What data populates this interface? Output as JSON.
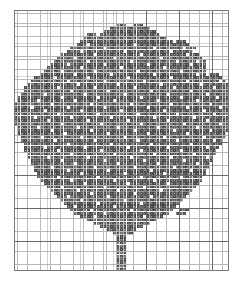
{
  "document": {
    "title": "Tree Cross-Stitch Pattern Chart",
    "kind": "counted cross-stitch / needlepoint chart",
    "subject": "deciduous tree with full leafy crown and straight trunk",
    "background_color": "#ffffff"
  },
  "grid": {
    "origin_x": 14,
    "origin_y": 10,
    "columns": 65,
    "rows": 79,
    "cell_size": 3.3,
    "minor_line_color": "#b8b8b8",
    "major_line_color": "#6b6b6b",
    "major_every": 10,
    "border_color": "#7a7a7a",
    "grid_on": true
  },
  "symbol": {
    "name": "filled-stitch",
    "fill_color": "#4a4a4a",
    "texture": "checker-dot",
    "empty_color": "#ffffff"
  },
  "chart_data": {
    "type": "heatmap",
    "title": "Tree Cross-Stitch Pattern Chart",
    "subtitle": "",
    "xlabel": "",
    "ylabel": "",
    "legend": [
      {
        "symbol": "filled-stitch",
        "label": "stitched cell",
        "color": "#4a4a4a"
      },
      {
        "symbol": "blank",
        "label": "unstitched cell",
        "color": "#ffffff"
      }
    ],
    "legend_position": "none",
    "grid": true,
    "xlim": [
      0,
      65
    ],
    "ylim": [
      0,
      79
    ],
    "categories": [],
    "values": [],
    "note": "Each row is encoded as run-length pairs of [start_column, length] of stitched (filled) cells. Columns are 0-indexed from the left edge of the grid; rows 0-indexed from the top.",
    "rows_rle": [
      [],
      [],
      [],
      [],
      [
        [
          31,
          3
        ],
        [
          36,
          3
        ]
      ],
      [
        [
          29,
          12
        ]
      ],
      [
        [
          27,
          16
        ]
      ],
      [
        [
          22,
          3
        ],
        [
          26,
          18
        ]
      ],
      [
        [
          21,
          5
        ],
        [
          25,
          21
        ]
      ],
      [
        [
          20,
          28
        ],
        [
          49,
          3
        ]
      ],
      [
        [
          19,
          30
        ],
        [
          48,
          5
        ]
      ],
      [
        [
          17,
          34
        ],
        [
          52,
          3
        ]
      ],
      [
        [
          16,
          38
        ]
      ],
      [
        [
          14,
          42
        ]
      ],
      [
        [
          13,
          44
        ]
      ],
      [
        [
          12,
          46
        ]
      ],
      [
        [
          11,
          47
        ]
      ],
      [
        [
          10,
          48
        ]
      ],
      [
        [
          9,
          49
        ]
      ],
      [
        [
          8,
          50
        ],
        [
          59,
          3
        ]
      ],
      [
        [
          6,
          3
        ],
        [
          9,
          49
        ],
        [
          58,
          5
        ]
      ],
      [
        [
          5,
          5
        ],
        [
          9,
          50
        ],
        [
          57,
          7
        ]
      ],
      [
        [
          4,
          7
        ],
        [
          10,
          50
        ],
        [
          57,
          8
        ]
      ],
      [
        [
          3,
          9
        ],
        [
          10,
          52
        ],
        [
          56,
          9
        ]
      ],
      [
        [
          3,
          62
        ]
      ],
      [
        [
          2,
          63
        ]
      ],
      [
        [
          1,
          64
        ]
      ],
      [
        [
          1,
          64
        ]
      ],
      [
        [
          0,
          65
        ]
      ],
      [
        [
          0,
          65
        ]
      ],
      [
        [
          0,
          65
        ]
      ],
      [
        [
          0,
          65
        ]
      ],
      [
        [
          0,
          65
        ]
      ],
      [
        [
          0,
          65
        ]
      ],
      [
        [
          0,
          65
        ]
      ],
      [
        [
          1,
          64
        ]
      ],
      [
        [
          1,
          64
        ]
      ],
      [
        [
          1,
          63
        ]
      ],
      [
        [
          2,
          62
        ]
      ],
      [
        [
          2,
          61
        ]
      ],
      [
        [
          3,
          60
        ]
      ],
      [
        [
          3,
          59
        ]
      ],
      [
        [
          3,
          58
        ]
      ],
      [
        [
          4,
          57
        ]
      ],
      [
        [
          4,
          56
        ]
      ],
      [
        [
          5,
          55
        ]
      ],
      [
        [
          5,
          54
        ]
      ],
      [
        [
          6,
          53
        ]
      ],
      [
        [
          6,
          52
        ]
      ],
      [
        [
          7,
          51
        ]
      ],
      [
        [
          7,
          50
        ]
      ],
      [
        [
          8,
          49
        ]
      ],
      [
        [
          9,
          47
        ]
      ],
      [
        [
          10,
          45
        ]
      ],
      [
        [
          11,
          43
        ]
      ],
      [
        [
          12,
          41
        ]
      ],
      [
        [
          13,
          39
        ]
      ],
      [
        [
          14,
          37
        ]
      ],
      [
        [
          15,
          35
        ]
      ],
      [
        [
          16,
          33
        ]
      ],
      [
        [
          17,
          31
        ],
        [
          50,
          3
        ]
      ],
      [
        [
          18,
          29
        ],
        [
          49,
          3
        ]
      ],
      [
        [
          20,
          25
        ]
      ],
      [
        [
          22,
          21
        ]
      ],
      [
        [
          24,
          17
        ]
      ],
      [
        [
          26,
          13
        ]
      ],
      [
        [
          28,
          9
        ]
      ],
      [
        [
          30,
          6
        ]
      ],
      [
        [
          31,
          3
        ]
      ],
      [
        [
          31,
          3
        ]
      ],
      [
        [
          31,
          3
        ]
      ],
      [
        [
          31,
          3
        ]
      ],
      [
        [
          31,
          3
        ]
      ],
      [
        [
          31,
          3
        ]
      ],
      [
        [
          31,
          3
        ]
      ],
      [
        [
          31,
          3
        ]
      ],
      [
        [
          31,
          3
        ]
      ],
      [
        [
          31,
          3
        ]
      ],
      [
        [
          31,
          3
        ]
      ],
      []
    ],
    "holes_rle": [
      [],
      [],
      [],
      [],
      [],
      [],
      [],
      [],
      [],
      [],
      [
        [
          22,
          1
        ],
        [
          36,
          1
        ]
      ],
      [
        [
          27,
          1
        ],
        [
          42,
          1
        ]
      ],
      [
        [
          20,
          1
        ],
        [
          33,
          1
        ],
        [
          47,
          1
        ]
      ],
      [
        [
          24,
          1
        ],
        [
          38,
          1
        ],
        [
          52,
          1
        ]
      ],
      [
        [
          18,
          1
        ],
        [
          30,
          1
        ],
        [
          44,
          1
        ]
      ],
      [
        [
          22,
          1
        ],
        [
          35,
          1
        ],
        [
          49,
          1
        ],
        [
          55,
          1
        ]
      ],
      [
        [
          16,
          1
        ],
        [
          27,
          1
        ],
        [
          40,
          1
        ],
        [
          53,
          1
        ]
      ],
      [
        [
          20,
          1
        ],
        [
          32,
          1
        ],
        [
          45,
          1
        ],
        [
          58,
          1
        ]
      ],
      [
        [
          14,
          1
        ],
        [
          24,
          1
        ],
        [
          37,
          1
        ],
        [
          50,
          1
        ]
      ],
      [
        [
          18,
          1
        ],
        [
          29,
          1
        ],
        [
          42,
          1
        ],
        [
          55,
          1
        ]
      ],
      [
        [
          12,
          1
        ],
        [
          22,
          1
        ],
        [
          34,
          1
        ],
        [
          47,
          1
        ]
      ],
      [
        [
          16,
          1
        ],
        [
          27,
          1
        ],
        [
          39,
          1
        ],
        [
          52,
          1
        ],
        [
          62,
          1
        ]
      ],
      [
        [
          19,
          1
        ],
        [
          31,
          1
        ],
        [
          44,
          1
        ],
        [
          56,
          1
        ]
      ],
      [
        [
          13,
          1
        ],
        [
          24,
          1
        ],
        [
          36,
          1
        ],
        [
          48,
          1
        ],
        [
          60,
          1
        ]
      ],
      [
        [
          17,
          1
        ],
        [
          28,
          1
        ],
        [
          41,
          1
        ],
        [
          53,
          1
        ]
      ],
      [
        [
          9,
          1
        ],
        [
          21,
          1
        ],
        [
          33,
          1
        ],
        [
          46,
          1
        ],
        [
          58,
          1
        ]
      ],
      [
        [
          14,
          1
        ],
        [
          25,
          1
        ],
        [
          38,
          1
        ],
        [
          50,
          1
        ],
        [
          61,
          1
        ]
      ],
      [
        [
          7,
          1
        ],
        [
          18,
          1
        ],
        [
          30,
          1
        ],
        [
          43,
          1
        ],
        [
          55,
          1
        ]
      ],
      [
        [
          11,
          1
        ],
        [
          23,
          1
        ],
        [
          35,
          1
        ],
        [
          47,
          1
        ],
        [
          59,
          1
        ]
      ],
      [
        [
          5,
          1
        ],
        [
          16,
          1
        ],
        [
          27,
          1
        ],
        [
          40,
          1
        ],
        [
          52,
          1
        ],
        [
          62,
          1
        ]
      ],
      [
        [
          9,
          1
        ],
        [
          20,
          1
        ],
        [
          32,
          1
        ],
        [
          45,
          1
        ],
        [
          57,
          1
        ]
      ],
      [
        [
          13,
          1
        ],
        [
          25,
          1
        ],
        [
          37,
          1
        ],
        [
          49,
          1
        ],
        [
          60,
          1
        ]
      ],
      [
        [
          6,
          1
        ],
        [
          17,
          1
        ],
        [
          29,
          1
        ],
        [
          42,
          1
        ],
        [
          54,
          1
        ]
      ],
      [
        [
          10,
          1
        ],
        [
          22,
          1
        ],
        [
          34,
          1
        ],
        [
          46,
          1
        ],
        [
          58,
          1
        ]
      ],
      [
        [
          14,
          1
        ],
        [
          26,
          1
        ],
        [
          38,
          1
        ],
        [
          51,
          1
        ],
        [
          62,
          1
        ]
      ],
      [
        [
          7,
          1
        ],
        [
          19,
          1
        ],
        [
          31,
          1
        ],
        [
          43,
          1
        ],
        [
          55,
          1
        ]
      ],
      [
        [
          11,
          1
        ],
        [
          23,
          1
        ],
        [
          36,
          1
        ],
        [
          48,
          1
        ],
        [
          59,
          1
        ]
      ],
      [
        [
          15,
          1
        ],
        [
          28,
          1
        ],
        [
          40,
          1
        ],
        [
          52,
          1
        ]
      ],
      [
        [
          8,
          1
        ],
        [
          20,
          1
        ],
        [
          33,
          1
        ],
        [
          45,
          1
        ],
        [
          57,
          1
        ]
      ],
      [
        [
          12,
          1
        ],
        [
          24,
          1
        ],
        [
          37,
          1
        ],
        [
          49,
          1
        ],
        [
          60,
          1
        ]
      ],
      [
        [
          16,
          1
        ],
        [
          29,
          1
        ],
        [
          41,
          1
        ],
        [
          53,
          1
        ]
      ],
      [
        [
          9,
          1
        ],
        [
          21,
          1
        ],
        [
          34,
          1
        ],
        [
          46,
          1
        ],
        [
          58,
          1
        ]
      ],
      [
        [
          13,
          1
        ],
        [
          26,
          1
        ],
        [
          38,
          1
        ],
        [
          50,
          1
        ]
      ],
      [
        [
          17,
          1
        ],
        [
          30,
          1
        ],
        [
          42,
          1
        ],
        [
          54,
          1
        ]
      ],
      [
        [
          10,
          1
        ],
        [
          22,
          1
        ],
        [
          35,
          1
        ],
        [
          47,
          1
        ],
        [
          58,
          1
        ]
      ],
      [
        [
          14,
          1
        ],
        [
          27,
          1
        ],
        [
          39,
          1
        ],
        [
          51,
          1
        ]
      ],
      [
        [
          18,
          1
        ],
        [
          31,
          1
        ],
        [
          43,
          1
        ],
        [
          55,
          1
        ]
      ],
      [
        [
          11,
          1
        ],
        [
          24,
          1
        ],
        [
          36,
          1
        ],
        [
          48,
          1
        ]
      ],
      [
        [
          16,
          1
        ],
        [
          28,
          1
        ],
        [
          41,
          1
        ],
        [
          53,
          1
        ]
      ],
      [
        [
          20,
          1
        ],
        [
          33,
          1
        ],
        [
          45,
          1
        ]
      ],
      [
        [
          13,
          1
        ],
        [
          25,
          1
        ],
        [
          38,
          1
        ],
        [
          50,
          1
        ]
      ],
      [
        [
          17,
          1
        ],
        [
          30,
          1
        ],
        [
          42,
          1
        ]
      ],
      [
        [
          21,
          1
        ],
        [
          34,
          1
        ],
        [
          46,
          1
        ]
      ],
      [
        [
          14,
          1
        ],
        [
          27,
          1
        ],
        [
          39,
          1
        ]
      ],
      [
        [
          19,
          1
        ],
        [
          31,
          1
        ],
        [
          44,
          1
        ]
      ],
      [
        [
          23,
          1
        ],
        [
          36,
          1
        ]
      ],
      [
        [
          16,
          1
        ],
        [
          28,
          1
        ],
        [
          41,
          1
        ]
      ],
      [
        [
          20,
          1
        ],
        [
          33,
          1
        ]
      ],
      [
        [
          25,
          1
        ],
        [
          38,
          1
        ]
      ],
      [
        [
          18,
          1
        ],
        [
          30,
          1
        ]
      ],
      [
        [
          23,
          1
        ],
        [
          35,
          1
        ]
      ],
      [
        [
          27,
          1
        ]
      ],
      [
        [
          24,
          1
        ],
        [
          39,
          1
        ]
      ],
      [],
      [],
      [],
      [],
      [],
      [],
      [],
      [],
      [],
      [],
      [],
      [],
      [],
      [],
      [],
      [],
      []
    ]
  }
}
